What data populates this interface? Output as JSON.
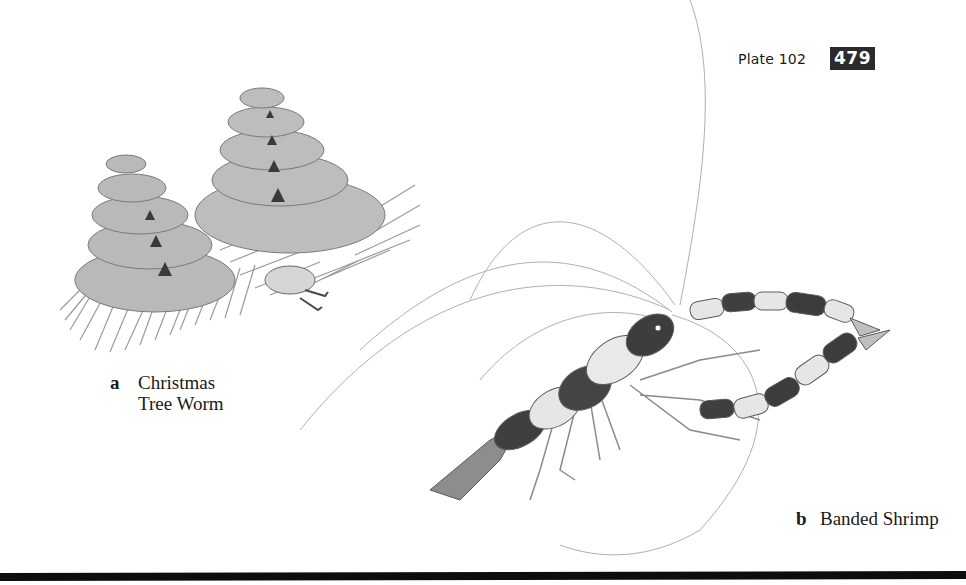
{
  "header": {
    "plate_label": "Plate 102",
    "page_number": "479"
  },
  "figures": [
    {
      "letter": "a",
      "name_line1": "Christmas",
      "name_line2": "Tree Worm",
      "icon": "christmas-tree-worm-illustration"
    },
    {
      "letter": "b",
      "name": "Banded Shrimp",
      "icon": "banded-shrimp-illustration"
    }
  ],
  "colors": {
    "page_background": "#ffffff",
    "page_number_box": "#2b2b2b",
    "text": "#1a1a1a",
    "bottom_rule": "#0d0d0d"
  }
}
